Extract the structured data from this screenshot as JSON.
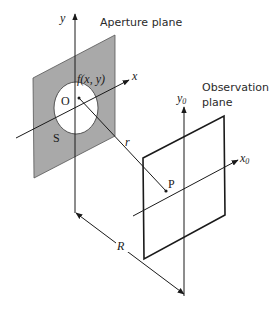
{
  "figure": {
    "type": "optics-diffraction-geometry",
    "labels": {
      "aperture_plane": "Aperture plane",
      "observation_plane_line1": "Observation",
      "observation_plane_line2": "plane",
      "y_axis": "y",
      "x_axis": "x",
      "y0_axis": "y",
      "y0_sub": "0",
      "x0_axis": "x",
      "x0_sub": "0",
      "aperture_function": "f(x, y)",
      "origin": "O",
      "aperture_region": "S",
      "distance_r": "r",
      "point_p": "P",
      "distance_R": "R"
    },
    "colors": {
      "aperture_fill": "#a9a9a9",
      "opening_fill": "#ffffff",
      "line": "#1a1a1a"
    }
  }
}
